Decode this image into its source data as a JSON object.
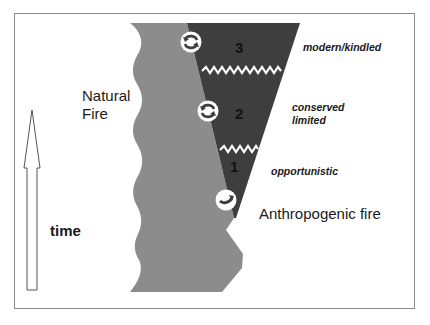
{
  "diagram": {
    "labels": {
      "natural_fire_line1": "Natural",
      "natural_fire_line2": "Fire",
      "anthropogenic_fire": "Anthropogenic fire",
      "time": "time"
    },
    "stages": [
      {
        "number": "1",
        "label_lines": [
          "opportunistic"
        ]
      },
      {
        "number": "2",
        "label_lines": [
          "conserved",
          "limited"
        ]
      },
      {
        "number": "3",
        "label_lines": [
          "modern/kindled"
        ]
      }
    ],
    "icons": [
      "exchange-arrows-icon",
      "exchange-arrows-icon",
      "exchange-arrows-icon"
    ],
    "colors": {
      "natural_fire_region": "#8c8c8c",
      "anthropogenic_region": "#3e3e3e",
      "zigzag_separator": "#ffffff",
      "frame": "#8a8a8a",
      "arrow_outline": "#555555"
    }
  }
}
